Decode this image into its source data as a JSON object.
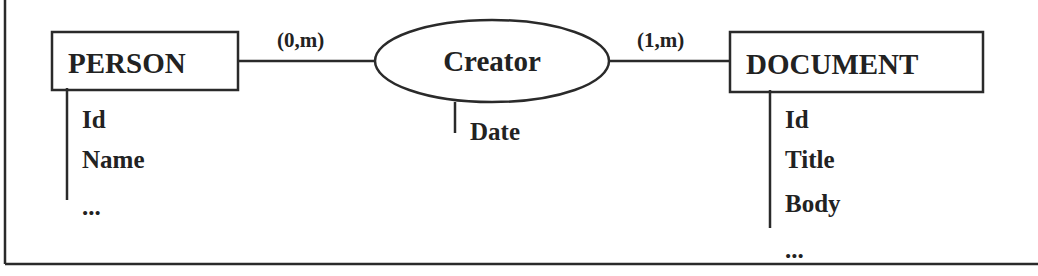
{
  "diagram": {
    "type": "entity-relationship",
    "entities": [
      {
        "name": "PERSON",
        "attributes": [
          "Id",
          "Name",
          "..."
        ]
      },
      {
        "name": "DOCUMENT",
        "attributes": [
          "Id",
          "Title",
          "Body",
          "..."
        ]
      }
    ],
    "relationship": {
      "name": "Creator",
      "attributes": [
        "Date"
      ],
      "cardinalities": {
        "person_side": "(0,m)",
        "document_side": "(1,m)"
      }
    }
  },
  "colors": {
    "ink": "#222222",
    "background": "#ffffff"
  }
}
